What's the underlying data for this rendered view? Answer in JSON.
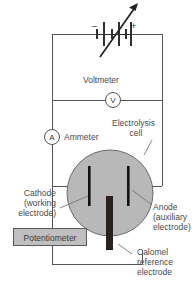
{
  "figure": {
    "type": "electrochemistry-circuit-diagram",
    "background": "#ffffff",
    "wire_color": "#555555",
    "cell_fill": "#b8b8b8",
    "cell_stroke": "#6b6b6b",
    "electrode_color": "#1a1a1a",
    "reference_electrode_color": "#2a211c",
    "box_fill": "#bfbfbf",
    "box_stroke": "#5a5a5a",
    "text_color": "#4a4a4a"
  },
  "source": {
    "name": "variable-dc-power-supply",
    "negative_sign": "–",
    "positive_sign": "+"
  },
  "meters": {
    "voltmeter": {
      "label": "Voltmeter",
      "symbol": "V"
    },
    "ammeter": {
      "label": "Ammeter",
      "symbol": "A"
    }
  },
  "cell": {
    "label_line1": "Electrolysis",
    "label_line2": "cell"
  },
  "electrodes": {
    "cathode": {
      "line1": "Cathode",
      "line2": "(working",
      "line3": "electrode)"
    },
    "anode": {
      "line1": "Anode",
      "line2": "(auxiliary",
      "line3": "electrode)"
    },
    "reference": {
      "line1": "Calomel",
      "line2": "reference",
      "line3": "electrode"
    }
  },
  "potentiometer": {
    "label": "Potentiometer"
  }
}
